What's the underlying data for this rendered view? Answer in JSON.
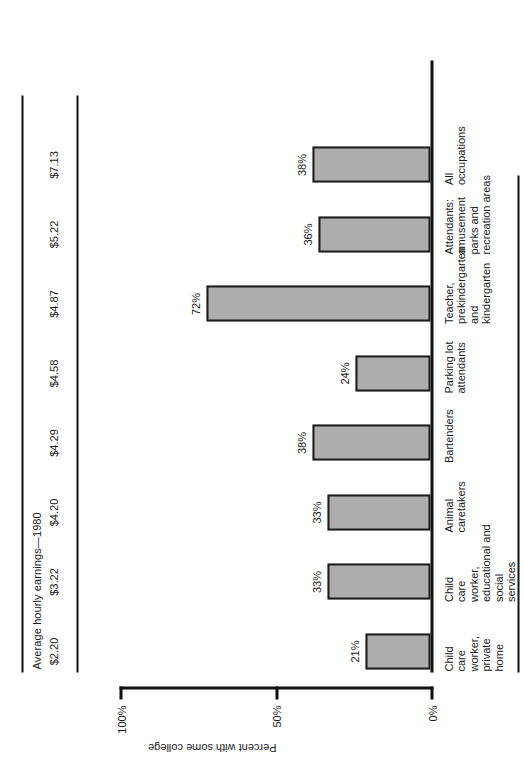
{
  "chart_data": {
    "type": "bar",
    "title": "Average hourly earnings—1980",
    "xlabel": "",
    "ylabel": "Percent with some college",
    "ylim": [
      0,
      100
    ],
    "ytick_labels": [
      "0%",
      "50%",
      "100%"
    ],
    "ytick_values": [
      0,
      50,
      100
    ],
    "grid": false,
    "legend": "none",
    "orientation": "vertical-bars-rotated",
    "categories": [
      "Child\ncare\nworker,\nprivate\nhome",
      "Child\ncare\nworker,\neducational and\nsocial\nservices",
      "Animal\ncaretakers",
      "Bartenders",
      "Parking lot\nattendants",
      "Teacher,\nprekindergarten\nand\nkindergarten",
      "Attendants:\namusement\nparks and\nrecreation areas",
      "All\noccupations"
    ],
    "values": [
      21,
      33,
      33,
      38,
      24,
      72,
      36,
      38
    ],
    "value_labels": [
      "21%",
      "33%",
      "33%",
      "38%",
      "24%",
      "72%",
      "36%",
      "38%"
    ],
    "secondary_series": {
      "name": "Average hourly earnings—1980",
      "values": [
        2.2,
        3.22,
        4.2,
        4.29,
        4.58,
        4.87,
        5.22,
        7.13
      ],
      "labels": [
        "$2.20",
        "$3.22",
        "$4.20",
        "$4.29",
        "$4.58",
        "$4.87",
        "$5.22",
        "$7.13"
      ]
    },
    "colors": {
      "bar_fill": "#adadad",
      "bar_stroke": "#1c1c1c",
      "axis": "#111111",
      "text": "#1a1a1a",
      "background": "#ffffff"
    }
  },
  "earnings_band": {
    "title": "Average hourly earnings—1980",
    "values": [
      "$2.20",
      "$3.22",
      "$4.20",
      "$4.29",
      "$4.58",
      "$4.87",
      "$5.22",
      "$7.13"
    ]
  },
  "axis": {
    "value_axis_title": "Percent with some college",
    "ticks": [
      "0%",
      "50%",
      "100%"
    ]
  },
  "bars": [
    {
      "category": "Child\ncare\nworker,\nprivate\nhome",
      "label": "21%",
      "value": 21
    },
    {
      "category": "Child\ncare\nworker,\neducational and\nsocial\nservices",
      "label": "33%",
      "value": 33
    },
    {
      "category": "Animal\ncaretakers",
      "label": "33%",
      "value": 33
    },
    {
      "category": "Bartenders",
      "label": "38%",
      "value": 38
    },
    {
      "category": "Parking lot\nattendants",
      "label": "24%",
      "value": 24
    },
    {
      "category": "Teacher,\nprekindergarten\nand\nkindergarten",
      "label": "72%",
      "value": 72
    },
    {
      "category": "Attendants:\namusement\nparks and\nrecreation areas",
      "label": "36%",
      "value": 36
    },
    {
      "category": "All\noccupations",
      "label": "38%",
      "value": 38
    }
  ]
}
